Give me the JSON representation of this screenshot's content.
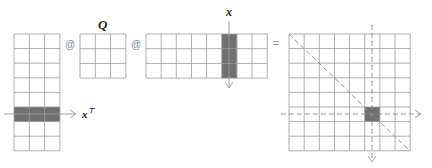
{
  "diagram": {
    "colors": {
      "grid": "#9a9a9a",
      "fill": "#707070",
      "arrow": "#9a9a9a",
      "dashed": "#8a8a8a",
      "label": "#222222",
      "operator": "#8a8a8a"
    },
    "operators": {
      "matmul_1": "@",
      "matmul_2": "@",
      "equals": "="
    },
    "labels": {
      "q": "Q",
      "x": "x",
      "xt_base": "x",
      "xt_sup": "⊤"
    },
    "matrices": [
      {
        "id": "left-matrix",
        "rows": 8,
        "cols": 3,
        "x": 14,
        "y": 34,
        "cell_w": 15.3,
        "cell_h": 14.6,
        "highlight": {
          "type": "row",
          "index": 5
        }
      },
      {
        "id": "q-matrix",
        "rows": 3,
        "cols": 3,
        "x": 80,
        "y": 34,
        "cell_w": 15.3,
        "cell_h": 14.7,
        "highlight": null
      },
      {
        "id": "middle-matrix",
        "rows": 3,
        "cols": 8,
        "x": 146,
        "y": 34,
        "cell_w": 15.15,
        "cell_h": 14.7,
        "highlight": {
          "type": "col",
          "index": 5
        }
      },
      {
        "id": "result-matrix",
        "rows": 8,
        "cols": 8,
        "x": 289,
        "y": 34,
        "cell_w": 15.15,
        "cell_h": 14.6,
        "highlight": {
          "type": "cell",
          "row": 5,
          "col": 5
        }
      }
    ]
  }
}
